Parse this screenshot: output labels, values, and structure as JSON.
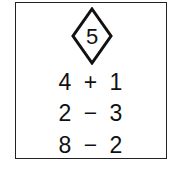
{
  "card": {
    "target_number": "5",
    "target_shape": "diamond",
    "expressions": [
      {
        "left": "4",
        "op": "+",
        "right": "1"
      },
      {
        "left": "2",
        "op": "−",
        "right": "3"
      },
      {
        "left": "8",
        "op": "−",
        "right": "2"
      }
    ]
  },
  "colors": {
    "ink": "#111111",
    "border": "#222222",
    "background": "#ffffff"
  }
}
